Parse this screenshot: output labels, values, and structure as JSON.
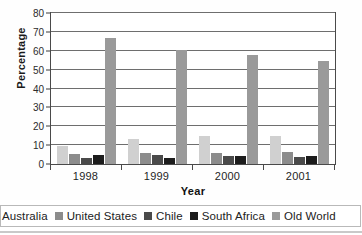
{
  "chart_data": {
    "type": "bar",
    "title": "",
    "subtitle": "",
    "xlabel": "Year",
    "ylabel": "Percentage",
    "categories": [
      "1998",
      "1999",
      "2000",
      "2001"
    ],
    "ylim": [
      0,
      80
    ],
    "ytick_step": 10,
    "yticks": [
      "0",
      "10",
      "20",
      "30",
      "40",
      "50",
      "60",
      "70",
      "80"
    ],
    "grid": "horizontal",
    "legend_position": "bottom",
    "series": [
      {
        "name": "Australia",
        "color": "#d0d0d0",
        "values": [
          9.8,
          13.2,
          15.0,
          14.8
        ]
      },
      {
        "name": "United States",
        "color": "#8c8c8c",
        "values": [
          5.5,
          5.6,
          5.9,
          6.5
        ]
      },
      {
        "name": "Chile",
        "color": "#4a4a4a",
        "values": [
          3.4,
          5.0,
          4.2,
          3.6
        ]
      },
      {
        "name": "South Africa",
        "color": "#1c1c1c",
        "values": [
          4.6,
          3.0,
          4.1,
          4.4
        ]
      },
      {
        "name": "Old World",
        "color": "#9a9a9a",
        "values": [
          67.0,
          60.5,
          58.0,
          54.8
        ]
      }
    ]
  }
}
